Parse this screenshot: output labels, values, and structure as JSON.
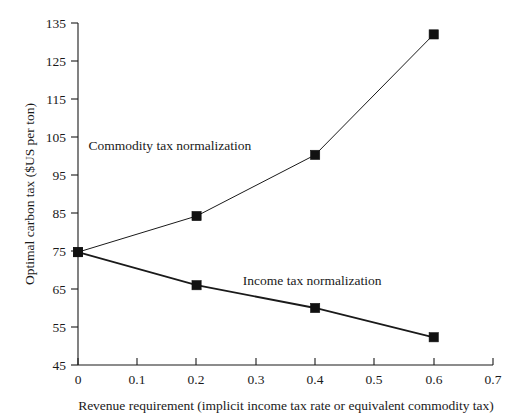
{
  "chart_data": {
    "type": "line",
    "title": "",
    "subtitle": "",
    "xlabel": "Revenue requirement (implicit income tax rate or equivalent commodity tax)",
    "ylabel": "Optimal carbon tax ($US per ton)",
    "xlim": [
      0,
      0.7
    ],
    "ylim": [
      45,
      135
    ],
    "xticks": [
      0,
      0.1,
      0.2,
      0.3,
      0.4,
      0.5,
      0.6,
      0.7
    ],
    "xticklabels": [
      "0",
      "0.1",
      "0.2",
      "0.3",
      "0.4",
      "0.5",
      "0.6",
      "0.7"
    ],
    "yticks": [
      45,
      55,
      65,
      75,
      85,
      95,
      105,
      115,
      125,
      135
    ],
    "yticklabels": [
      "45",
      "55",
      "65",
      "75",
      "85",
      "95",
      "105",
      "115",
      "125",
      "135"
    ],
    "grid": false,
    "legend_position": "inline-annotation",
    "x": [
      0,
      0.2,
      0.4,
      0.6
    ],
    "series": [
      {
        "name": "Commodity tax normalization",
        "values": [
          74.7,
          84.2,
          100.3,
          132.0
        ],
        "marker": "square",
        "color": "#111111",
        "annotation": {
          "text": "Commodity tax normalization",
          "x": 0.155,
          "y": 101.5
        }
      },
      {
        "name": "Income tax normalization",
        "values": [
          74.7,
          66.0,
          60.0,
          52.3
        ],
        "marker": "square",
        "color": "#111111",
        "annotation": {
          "text": "Income tax normalization",
          "x": 0.395,
          "y": 66.0
        }
      }
    ]
  }
}
